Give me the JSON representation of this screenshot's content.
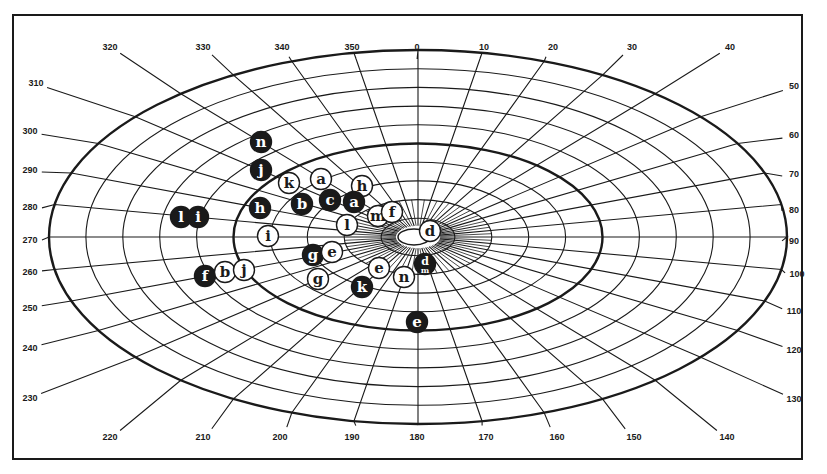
{
  "diagram": {
    "type": "elliptical-polar-grid",
    "center": {
      "x": 418,
      "y": 237
    },
    "outer_ellipse": {
      "rx": 369,
      "ry": 187
    },
    "ring_count": 10,
    "thick_rings": [
      5,
      10
    ],
    "angle_step_deg": 10,
    "colors": {
      "ink": "#1a1a1a",
      "paper": "#ffffff"
    },
    "angle_labels": [
      {
        "text": "0",
        "x": 417,
        "y": 47
      },
      {
        "text": "10",
        "x": 484,
        "y": 47
      },
      {
        "text": "20",
        "x": 553,
        "y": 47
      },
      {
        "text": "30",
        "x": 632,
        "y": 47
      },
      {
        "text": "40",
        "x": 730,
        "y": 47
      },
      {
        "text": "50",
        "x": 794,
        "y": 86
      },
      {
        "text": "60",
        "x": 794,
        "y": 135
      },
      {
        "text": "70",
        "x": 794,
        "y": 174
      },
      {
        "text": "80",
        "x": 794,
        "y": 210
      },
      {
        "text": "90",
        "x": 794,
        "y": 241
      },
      {
        "text": "100",
        "x": 797,
        "y": 274
      },
      {
        "text": "110",
        "x": 794,
        "y": 311
      },
      {
        "text": "120",
        "x": 794,
        "y": 350
      },
      {
        "text": "130",
        "x": 794,
        "y": 399
      },
      {
        "text": "140",
        "x": 727,
        "y": 437
      },
      {
        "text": "150",
        "x": 634,
        "y": 437
      },
      {
        "text": "160",
        "x": 557,
        "y": 437
      },
      {
        "text": "170",
        "x": 486,
        "y": 437
      },
      {
        "text": "180",
        "x": 417,
        "y": 437
      },
      {
        "text": "190",
        "x": 352,
        "y": 437
      },
      {
        "text": "200",
        "x": 280,
        "y": 437
      },
      {
        "text": "210",
        "x": 203,
        "y": 437
      },
      {
        "text": "220",
        "x": 110,
        "y": 437
      },
      {
        "text": "230",
        "x": 30,
        "y": 398
      },
      {
        "text": "240",
        "x": 30,
        "y": 348
      },
      {
        "text": "250",
        "x": 30,
        "y": 308
      },
      {
        "text": "260",
        "x": 30,
        "y": 272
      },
      {
        "text": "270",
        "x": 30,
        "y": 240
      },
      {
        "text": "280",
        "x": 30,
        "y": 207
      },
      {
        "text": "290",
        "x": 30,
        "y": 170
      },
      {
        "text": "300",
        "x": 30,
        "y": 131
      },
      {
        "text": "310",
        "x": 36,
        "y": 83
      },
      {
        "text": "320",
        "x": 110,
        "y": 47
      },
      {
        "text": "330",
        "x": 203,
        "y": 47
      },
      {
        "text": "340",
        "x": 282,
        "y": 47
      },
      {
        "text": "350",
        "x": 352,
        "y": 47
      }
    ],
    "markers": [
      {
        "letter": "n",
        "filled": true,
        "x": 261,
        "y": 142
      },
      {
        "letter": "j",
        "filled": true,
        "x": 261,
        "y": 170
      },
      {
        "letter": "k",
        "filled": false,
        "x": 289,
        "y": 183
      },
      {
        "letter": "a",
        "filled": false,
        "x": 321,
        "y": 179
      },
      {
        "letter": "h",
        "filled": false,
        "x": 362,
        "y": 186
      },
      {
        "letter": "h",
        "filled": true,
        "x": 260,
        "y": 208
      },
      {
        "letter": "b",
        "filled": true,
        "x": 302,
        "y": 204
      },
      {
        "letter": "c",
        "filled": true,
        "x": 330,
        "y": 200
      },
      {
        "letter": "a",
        "filled": true,
        "x": 354,
        "y": 202
      },
      {
        "letter": "l",
        "filled": true,
        "x": 181,
        "y": 217
      },
      {
        "letter": "i",
        "filled": true,
        "x": 198,
        "y": 217
      },
      {
        "letter": "l",
        "filled": false,
        "x": 347,
        "y": 225
      },
      {
        "letter": "m",
        "filled": false,
        "x": 378,
        "y": 216
      },
      {
        "letter": "f",
        "filled": false,
        "x": 392,
        "y": 212
      },
      {
        "letter": "i",
        "filled": false,
        "x": 268,
        "y": 236
      },
      {
        "letter": "d",
        "filled": false,
        "x": 430,
        "y": 231
      },
      {
        "letter": "g",
        "filled": true,
        "x": 313,
        "y": 255
      },
      {
        "letter": "e",
        "filled": false,
        "x": 332,
        "y": 252
      },
      {
        "letter": "f",
        "filled": true,
        "x": 205,
        "y": 276
      },
      {
        "letter": "b",
        "filled": false,
        "x": 225,
        "y": 272
      },
      {
        "letter": "j",
        "filled": false,
        "x": 244,
        "y": 270
      },
      {
        "letter": "g",
        "filled": false,
        "x": 318,
        "y": 279
      },
      {
        "letter": "e",
        "filled": false,
        "x": 379,
        "y": 268
      },
      {
        "letter": "n",
        "filled": false,
        "x": 404,
        "y": 277
      },
      {
        "letter": "d",
        "filled": true,
        "x": 425,
        "y": 264,
        "sub": "m"
      },
      {
        "letter": "k",
        "filled": true,
        "x": 362,
        "y": 287
      },
      {
        "letter": "e",
        "filled": true,
        "x": 417,
        "y": 322
      }
    ]
  }
}
